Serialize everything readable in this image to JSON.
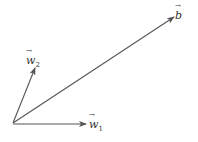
{
  "diagram": {
    "type": "vector diagram",
    "origin": [
      13,
      123
    ],
    "vectors": [
      {
        "id": "b",
        "label": "b",
        "subscript": "",
        "tip": [
          174,
          17
        ],
        "label_pos": [
          175,
          10
        ]
      },
      {
        "id": "w2",
        "label": "w",
        "subscript": "2",
        "tip": [
          35,
          68
        ],
        "label_pos": [
          26,
          55
        ]
      },
      {
        "id": "w1",
        "label": "w",
        "subscript": "1",
        "tip": [
          86,
          124
        ],
        "label_pos": [
          89,
          119
        ]
      }
    ],
    "stroke_color": "#555555",
    "label_color": "#333333"
  }
}
